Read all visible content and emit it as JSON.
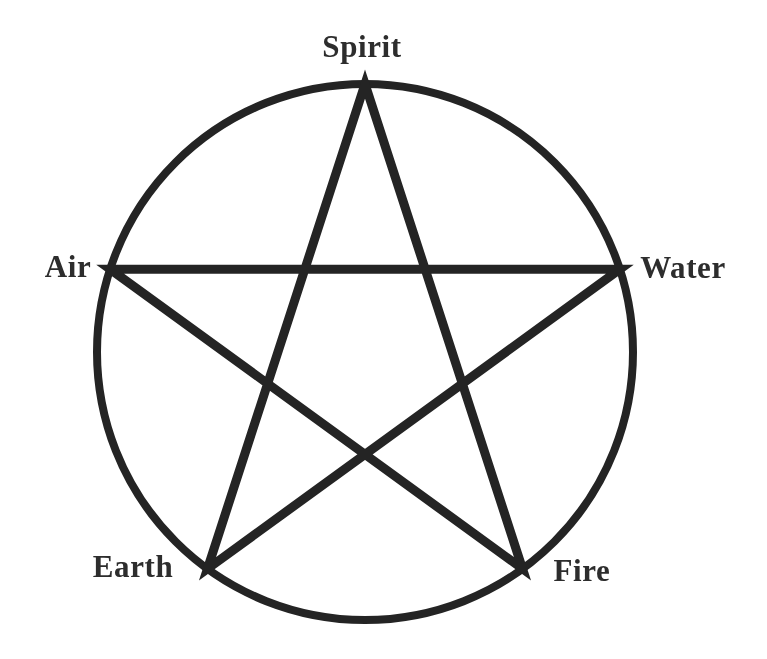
{
  "diagram": {
    "kind": "pentagram-in-circle",
    "labels": {
      "top": "Spirit",
      "left": "Air",
      "right": "Water",
      "bottom_left": "Earth",
      "bottom_right": "Fire"
    },
    "colors": {
      "background": "#ffffff",
      "stroke": "#242424",
      "text": "#2d2d2d"
    },
    "geometry": {
      "center_x": 365,
      "center_y": 352,
      "radius": 268,
      "circle_stroke_width": 8,
      "star_stroke_width": 9,
      "point_angles_deg": [
        90,
        162,
        234,
        306,
        18
      ],
      "star_vertex_order": [
        0,
        3,
        1,
        4,
        2
      ]
    }
  }
}
